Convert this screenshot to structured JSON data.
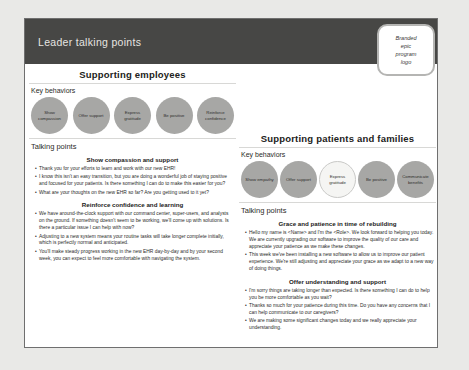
{
  "colors": {
    "page_bg": "#e9e9e7",
    "card_bg": "#ffffff",
    "card_border": "#6f6f6f",
    "header_bg": "#474745",
    "header_text": "#e6e5e1",
    "logo_border": "#b5b5b3",
    "rule_color": "#d8d8d6",
    "circle_fill": "#a7a7a5",
    "circle_light_fill": "#f5f5f3",
    "circle_light_border": "#c9c9c7"
  },
  "header": {
    "title": "Leader talking points"
  },
  "logo": {
    "lines": [
      "Branded",
      "epic",
      "program",
      "logo"
    ]
  },
  "left_section": {
    "title": "Supporting employees",
    "key_behaviors_label": "Key behaviors",
    "behaviors": [
      "Show compassion",
      "Offer support",
      "Express gratitude",
      "Be positive",
      "Reinforce confidence"
    ],
    "talking_points_label": "Talking points",
    "groups": [
      {
        "heading": "Show compassion and support",
        "bullets": [
          "Thank you for your efforts to learn and work with our new EHR!",
          "I know this isn't an easy transition, but you are doing a wonderful job of staying positive and focused for your patients. Is there something I can do to make this easier for you?",
          "What are your thoughts on the new EHR so far? Are you getting used to it yet?"
        ]
      },
      {
        "heading": "Reinforce confidence and learning",
        "bullets": [
          "We have around-the-clock support with our command center, super-users, and analysts on the ground. If something doesn't seem to be working, we'll come up with solutions. Is there a particular issue I can help with now?",
          "Adjusting to a new system means your routine tasks will take longer complete initially, which is perfectly normal and anticipated.",
          "You'll make steady progress working in the new EHR day-by-day and by your second week, you can expect to feel more comfortable with navigating the system."
        ]
      }
    ]
  },
  "right_section": {
    "title": "Supporting patients and families",
    "key_behaviors_label": "Key behaviors",
    "behaviors": [
      "Show empathy",
      "Offer support",
      "Express gratitude",
      "Be positive",
      "Communicate benefits"
    ],
    "talking_points_label": "Talking points",
    "groups": [
      {
        "heading": "Grace and patience in time of rebuilding",
        "bullets": [
          "Hello my name is <Name> and I'm the <Role>. We look forward to helping you today. We are currently upgrading our software to improve the quality of our care and appreciate your patience as we make these changes.",
          "This week we've been installing a new software to allow us to improve our patient experience. We're still adjusting and appreciate your grace as we adapt to a new way of doing things."
        ]
      },
      {
        "heading": "Offer understanding and support",
        "bullets": [
          "I'm sorry things are taking longer than expected. Is there something I can do to help you be more comfortable as you wait?",
          "Thanks so much for your patience during this time. Do you have any concerns that I can help communicate to our caregivers?",
          "We are making some significant changes today and we really appreciate your understanding."
        ]
      }
    ]
  }
}
